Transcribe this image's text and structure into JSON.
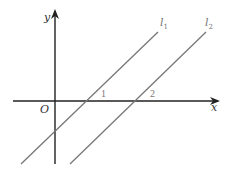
{
  "diagram": {
    "type": "coordinate-plane",
    "axes": {
      "x_label": "x",
      "y_label": "y",
      "origin_label": "O",
      "axis_color": "#222222"
    },
    "lines": [
      {
        "name": "l1",
        "label_base": "l",
        "label_sub": "1",
        "x_intercept_label": "1",
        "color": "#777777"
      },
      {
        "name": "l2",
        "label_base": "l",
        "label_sub": "2",
        "x_intercept_label": "2",
        "color": "#777777"
      }
    ],
    "relationship": "l1 parallel to l2"
  }
}
